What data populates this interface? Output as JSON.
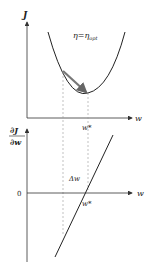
{
  "diagram": {
    "top_plot": {
      "y_axis_label": "J",
      "x_axis_label": "w",
      "annotation_eta": "η=η",
      "annotation_eta_sub": "opt",
      "min_label": "w*",
      "curve": "parabola",
      "step_arrow": "gradient step to minimum"
    },
    "bottom_plot": {
      "y_axis_label_num": "∂J",
      "y_axis_label_den": "∂w",
      "origin_label": "0",
      "x_axis_label": "w",
      "delta_label": "Δw",
      "zero_crossing_label": "w*",
      "curve": "line"
    },
    "colors": {
      "axis": "#333333",
      "curve": "#222222",
      "arrow": "#777777",
      "dashed": "#999999"
    }
  }
}
